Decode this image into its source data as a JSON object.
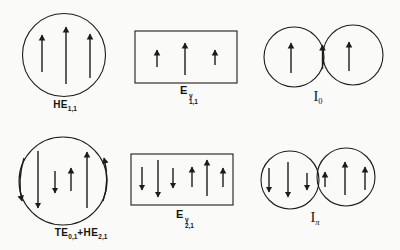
{
  "figure": {
    "background": "#fafaf8",
    "ink": "#1c1c1c",
    "description_rows": 2,
    "description_cols": 3
  },
  "labels": {
    "he11": {
      "main": "HE",
      "sub": "1,1"
    },
    "ey11": {
      "main": "E",
      "sup": "y",
      "sub": "1,1"
    },
    "i0": {
      "main": "I",
      "sub": "0"
    },
    "te01_he21": {
      "p1": "TE",
      "s1": "0,1",
      "p2": "+HE",
      "s2": "2,1"
    },
    "ey21": {
      "main": "E",
      "sup": "y",
      "sub": "2,1"
    },
    "ipi": {
      "main": "I",
      "sub": "π"
    }
  },
  "panels": [
    {
      "id": "he11-mode",
      "shapes": [
        {
          "type": "circle",
          "cx": 64,
          "cy": 55,
          "r": 41.5
        }
      ],
      "arrows": [
        {
          "x": 42,
          "y1": 72,
          "y2": 35
        },
        {
          "x": 66,
          "y1": 84,
          "y2": 27
        },
        {
          "x": 90,
          "y1": 78,
          "y2": 34
        }
      ]
    },
    {
      "id": "ey11-mode",
      "shapes": [
        {
          "type": "rect",
          "x": 135,
          "y": 31,
          "w": 102,
          "h": 52
        }
      ],
      "arrows": [
        {
          "x": 157,
          "y1": 67,
          "y2": 50
        },
        {
          "x": 185,
          "y1": 75,
          "y2": 43
        },
        {
          "x": 215,
          "y1": 65,
          "y2": 50
        }
      ]
    },
    {
      "id": "i0-supermode",
      "shapes": [
        {
          "type": "circle",
          "cx": 294,
          "cy": 57,
          "r": 30
        },
        {
          "type": "circle",
          "cx": 353,
          "cy": 55,
          "r": 30
        }
      ],
      "arrows": [
        {
          "x": 291,
          "y1": 73,
          "y2": 43
        },
        {
          "x": 349,
          "y1": 71,
          "y2": 42
        },
        {
          "x": 322.5,
          "y1": 69,
          "y2": 45,
          "w": 2.2
        }
      ]
    },
    {
      "id": "te01-he21-mode",
      "shapes": [
        {
          "type": "circle",
          "cx": 63,
          "cy": 181,
          "r": 44
        }
      ],
      "arrows": [
        {
          "path": "M 24,158 Q 17,181 22,201"
        },
        {
          "x": 38,
          "y1": 151,
          "y2": 208,
          "w": 1.8
        },
        {
          "x": 55,
          "y1": 171,
          "y2": 193
        },
        {
          "x": 71,
          "y1": 191,
          "y2": 168
        },
        {
          "x": 87,
          "y1": 208,
          "y2": 152,
          "w": 1.8
        },
        {
          "path": "M 103,201 Q 110,181 104,158"
        }
      ]
    },
    {
      "id": "ey21-mode",
      "shapes": [
        {
          "type": "rect",
          "x": 131,
          "y": 154,
          "w": 102,
          "h": 51
        }
      ],
      "arrows": [
        {
          "x": 142,
          "y1": 167,
          "y2": 190
        },
        {
          "x": 158,
          "y1": 160,
          "y2": 197,
          "w": 1.6
        },
        {
          "x": 173,
          "y1": 168,
          "y2": 188
        },
        {
          "x": 192,
          "y1": 187,
          "y2": 167
        },
        {
          "x": 207,
          "y1": 196,
          "y2": 160,
          "w": 1.6
        },
        {
          "x": 223,
          "y1": 187,
          "y2": 168
        }
      ]
    },
    {
      "id": "ipi-supermode",
      "shapes": [
        {
          "type": "circle",
          "cx": 290,
          "cy": 180,
          "r": 29
        },
        {
          "type": "circle",
          "cx": 346,
          "cy": 177,
          "r": 29
        }
      ],
      "arrows": [
        {
          "x": 269,
          "y1": 168,
          "y2": 192,
          "w": 1.6
        },
        {
          "x": 288,
          "y1": 162,
          "y2": 197,
          "w": 1.6
        },
        {
          "x": 307,
          "y1": 173,
          "y2": 190
        },
        {
          "x": 325,
          "y1": 187,
          "y2": 172
        },
        {
          "x": 345,
          "y1": 195,
          "y2": 162,
          "w": 1.6
        },
        {
          "x": 365,
          "y1": 190,
          "y2": 167,
          "w": 1.6
        }
      ]
    }
  ]
}
